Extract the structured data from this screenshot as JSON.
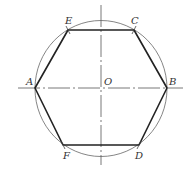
{
  "diagram": {
    "center": {
      "label": "O",
      "x": 101,
      "y": 88
    },
    "circle": {
      "rx": 66,
      "ry": 68,
      "stroke": "#555555"
    },
    "axes": {
      "horizontal": {
        "x1": 18,
        "x2": 183,
        "y": 88
      },
      "vertical": {
        "x": 101,
        "y1": 5,
        "y2": 165
      },
      "stroke": "#555555",
      "style": "dash-dot"
    },
    "vertices": [
      {
        "label": "A",
        "x": 35,
        "y": 88
      },
      {
        "label": "E",
        "x": 68,
        "y": 30
      },
      {
        "label": "C",
        "x": 134,
        "y": 30
      },
      {
        "label": "B",
        "x": 167,
        "y": 88
      },
      {
        "label": "D",
        "x": 139,
        "y": 145
      },
      {
        "label": "F",
        "x": 63,
        "y": 145
      }
    ],
    "hexagon_stroke": "#222222",
    "labels": {
      "A": "A",
      "B": "B",
      "C": "C",
      "D": "D",
      "E": "E",
      "F": "F",
      "O": "O"
    }
  }
}
